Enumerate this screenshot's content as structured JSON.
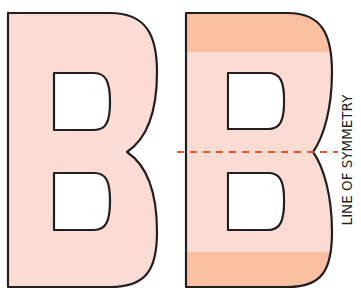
{
  "figure": {
    "label": "LINE OF SYMMETRY",
    "letters": [
      {
        "name": "left-b",
        "glyph": "B",
        "fill": "#fbdcd4"
      },
      {
        "name": "right-b",
        "glyph": "B",
        "fill": "#fbdcd4",
        "band_fill": "#f8bfa0"
      }
    ],
    "colors": {
      "letter_fill": "#fbdcd4",
      "band_fill": "#f8bfa0",
      "outline": "#231f20",
      "symmetry_line": "#e8562a",
      "background": "#ffffff"
    }
  }
}
